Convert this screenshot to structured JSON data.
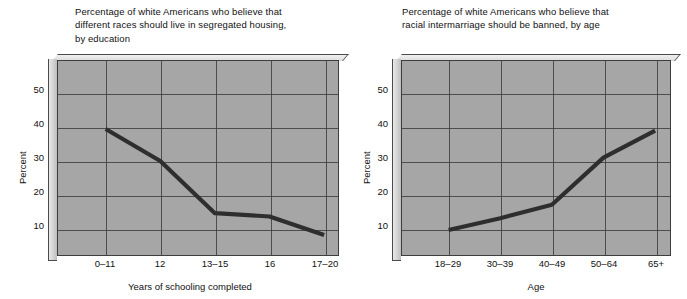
{
  "chart_data": [
    {
      "id": "segregated-housing-by-education",
      "type": "line",
      "title": "Percentage of white Americans who believe that\ndifferent races should live in segregated housing,\nby education",
      "xlabel": "Years of schooling completed",
      "ylabel": "Percent",
      "categories": [
        "0–11",
        "12",
        "13–15",
        "16",
        "17–20"
      ],
      "values": [
        39.5,
        30,
        14.5,
        13.5,
        8
      ],
      "yticks": [
        10,
        20,
        30,
        40,
        50
      ],
      "ylim": [
        0,
        58
      ],
      "grid": true,
      "legend": "none",
      "line_color": "#2e2e2e",
      "plot_background": "#a6a6a6"
    },
    {
      "id": "intermarriage-banned-by-age",
      "type": "line",
      "title": "Percentage of white Americans who believe that\nracial intermarriage should be banned, by age",
      "xlabel": "Age",
      "ylabel": "Percent",
      "categories": [
        "18–29",
        "30–39",
        "40–49",
        "50–64",
        "65+"
      ],
      "values": [
        9.5,
        13,
        17,
        31,
        39
      ],
      "yticks": [
        10,
        20,
        30,
        40,
        50
      ],
      "ylim": [
        0,
        58
      ],
      "grid": true,
      "legend": "none",
      "line_color": "#2e2e2e",
      "plot_background": "#a6a6a6"
    }
  ]
}
